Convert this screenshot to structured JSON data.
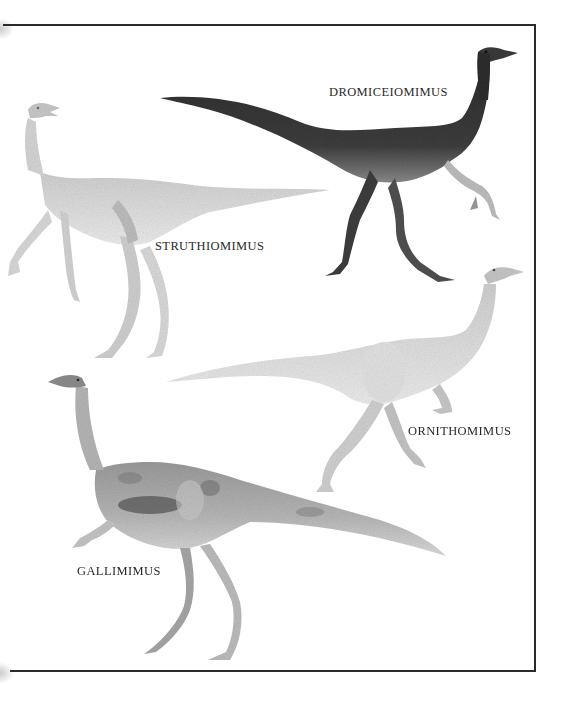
{
  "illustration": {
    "description": "Plate of four ornithomimid dinosaurs inside a three-sided ruled frame",
    "frame_color": "#2b2b2b",
    "background": "#ffffff",
    "figures": [
      {
        "name": "DROMICEIOMIMUS",
        "tone": "dark",
        "fill": "#3a3a3a",
        "label_x": 329,
        "label_y": 86
      },
      {
        "name": "STRUTHIOMIMUS",
        "tone": "pale",
        "fill": "#dcdcdc",
        "label_x": 155,
        "label_y": 240
      },
      {
        "name": "ORNITHOMIMUS",
        "tone": "pale",
        "fill": "#d6d6d6",
        "label_x": 408,
        "label_y": 425
      },
      {
        "name": "GALLIMIMUS",
        "tone": "mottled",
        "fill": "#a9a9a9",
        "label_x": 77,
        "label_y": 565
      }
    ]
  }
}
